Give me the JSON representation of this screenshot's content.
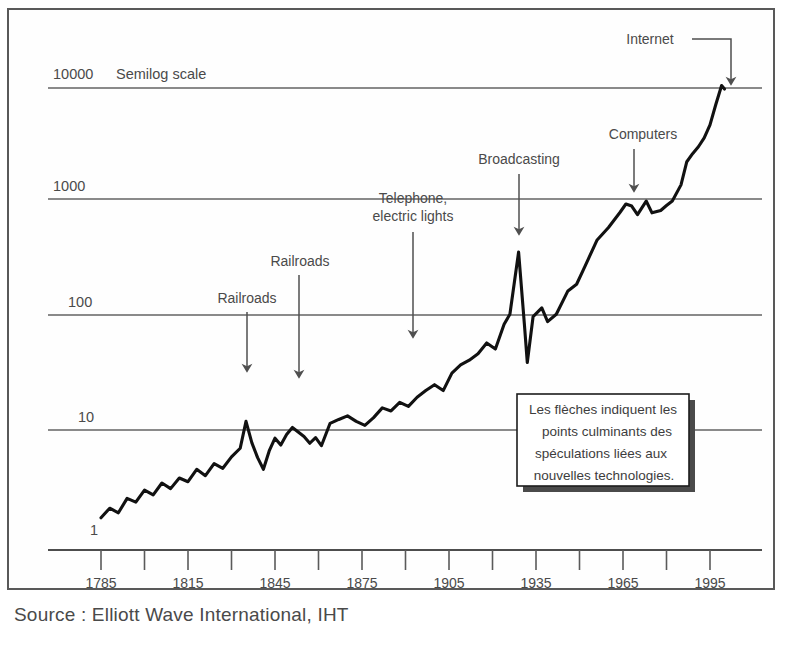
{
  "figure": {
    "source_note": "Source : Elliott Wave International, IHT",
    "semilog_note": "Semilog scale"
  },
  "callout": {
    "line1": "Les flèches indiquent les",
    "line2": "points culminants des",
    "line3": "spéculations liées aux",
    "line4": "nouvelles technologies."
  },
  "chart_data": {
    "type": "line",
    "title": "",
    "subtitle": "",
    "xlabel": "",
    "ylabel": "",
    "yscale": "log",
    "ylim": [
      1,
      10000
    ],
    "xlim": [
      1785,
      2000
    ],
    "grid": true,
    "legend_position": "none",
    "y_ticks": [
      "10000",
      "1000",
      "100",
      "10",
      "1"
    ],
    "y_tick_values": [
      10000,
      1000,
      100,
      10,
      1
    ],
    "x_ticks": [
      "1785",
      "1815",
      "1845",
      "1875",
      "1905",
      "1935",
      "1965",
      "1995"
    ],
    "x_tick_values": [
      1785,
      1815,
      1845,
      1875,
      1905,
      1935,
      1965,
      1995
    ],
    "x_minor_tick_values": [
      1800,
      1830,
      1860,
      1890,
      1920,
      1950,
      1980
    ],
    "series": [
      {
        "name": "US stock market index",
        "x": [
          1785,
          1788,
          1791,
          1794,
          1797,
          1800,
          1803,
          1806,
          1809,
          1812,
          1815,
          1818,
          1821,
          1824,
          1827,
          1830,
          1833,
          1835,
          1837,
          1839,
          1841,
          1843,
          1845,
          1847,
          1849,
          1851,
          1853,
          1855,
          1857,
          1859,
          1861,
          1864,
          1867,
          1870,
          1873,
          1876,
          1879,
          1882,
          1885,
          1888,
          1891,
          1894,
          1897,
          1900,
          1903,
          1906,
          1909,
          1912,
          1915,
          1918,
          1921,
          1924,
          1926,
          1929,
          1931,
          1932,
          1934,
          1937,
          1939,
          1942,
          1946,
          1949,
          1952,
          1956,
          1960,
          1964,
          1966,
          1968,
          1970,
          1973,
          1975,
          1978,
          1980,
          1982,
          1985,
          1987,
          1989,
          1991,
          1993,
          1995,
          1997,
          1999,
          2000
        ],
        "values": [
          1.9,
          2.3,
          2.1,
          2.8,
          2.6,
          3.3,
          3.0,
          3.8,
          3.4,
          4.2,
          3.9,
          5.0,
          4.4,
          5.6,
          5.1,
          6.4,
          7.6,
          13.0,
          8.5,
          6.3,
          5.0,
          7.2,
          9.3,
          8.1,
          10.0,
          11.5,
          10.5,
          9.6,
          8.4,
          9.4,
          8.0,
          12.5,
          13.5,
          14.5,
          13.0,
          12.0,
          14.0,
          17.0,
          16.0,
          19.0,
          17.5,
          21.0,
          24.0,
          27.0,
          24.0,
          34.0,
          40.0,
          44.0,
          50.0,
          62.0,
          55.0,
          90.0,
          110.0,
          380.0,
          90.0,
          42.0,
          105.0,
          125.0,
          95.0,
          110.0,
          175.0,
          200.0,
          290.0,
          480.0,
          620.0,
          840.0,
          990.0,
          950.0,
          800.0,
          1050.0,
          830.0,
          870.0,
          960.0,
          1050.0,
          1450.0,
          2300.0,
          2700.0,
          3100.0,
          3700.0,
          4800.0,
          7200.0,
          10500.0,
          9800.0
        ]
      }
    ],
    "annotations": [
      {
        "label": "Railroads",
        "x_year": 1838,
        "peak_value": 13
      },
      {
        "label": "Railroads",
        "x_year": 1853,
        "peak_value": 11.5
      },
      {
        "label": "Telephone,\nelectric lights",
        "line1": "Telephone,",
        "line2": "electric lights",
        "x_year": 1892,
        "peak_value": 24
      },
      {
        "label": "Broadcasting",
        "x_year": 1929,
        "peak_value": 380
      },
      {
        "label": "Computers",
        "x_year": 1969,
        "peak_value": 990
      },
      {
        "label": "Internet",
        "x_year": 1999,
        "peak_value": 10500
      }
    ]
  }
}
